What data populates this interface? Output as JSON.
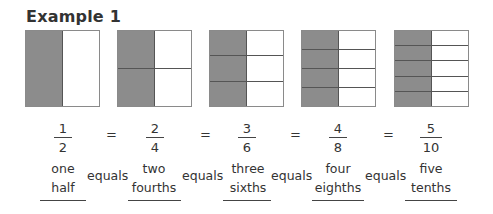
{
  "title": "Example 1",
  "shade_color": "#8c8c8c",
  "models": [
    {
      "rows": 1,
      "shaded_cols": 1,
      "cols": 2
    },
    {
      "rows": 2,
      "shaded_cols": 1,
      "cols": 2
    },
    {
      "rows": 3,
      "shaded_cols": 1,
      "cols": 2
    },
    {
      "rows": 4,
      "shaded_cols": 1,
      "cols": 2
    },
    {
      "rows": 5,
      "shaded_cols": 1,
      "cols": 2
    }
  ],
  "fractions": [
    {
      "num": "1",
      "den": "2"
    },
    {
      "num": "2",
      "den": "4"
    },
    {
      "num": "3",
      "den": "6"
    },
    {
      "num": "4",
      "den": "8"
    },
    {
      "num": "5",
      "den": "10"
    }
  ],
  "equals_symbol": "=",
  "words": [
    {
      "line1": "one",
      "line2": "half"
    },
    {
      "line1": "two",
      "line2": "fourths"
    },
    {
      "line1": "three",
      "line2": "sixths"
    },
    {
      "line1": "four",
      "line2": "eighths"
    },
    {
      "line1": "five",
      "line2": "tenths"
    }
  ],
  "equals_word": "equals"
}
